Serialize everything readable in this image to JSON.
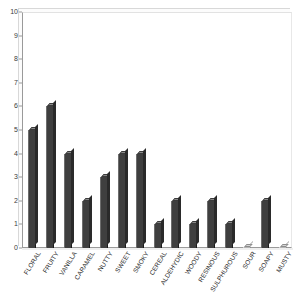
{
  "chart_data": {
    "type": "bar",
    "title": "",
    "subtitle": "",
    "xlabel": "",
    "ylabel": "",
    "ylim": [
      0,
      10
    ],
    "ytick_step": 1,
    "grid": false,
    "legend": "none",
    "orientation": "vertical",
    "bar_color": "#3f3f3f",
    "bar_style": "3d-column",
    "categories": [
      "FLORAL",
      "FRUITY",
      "VANILLA",
      "CARAMEL",
      "NUTTY",
      "SWEET",
      "SMOKY",
      "CEREAL",
      "ALDEHYDIC",
      "WOODY",
      "RESINOUS",
      "SULPHUROUS",
      "SOUR",
      "SOAPY",
      "MUSTY"
    ],
    "values": [
      5,
      6,
      4,
      2,
      3,
      4,
      4,
      1,
      2,
      1,
      2,
      1,
      0,
      2,
      0
    ],
    "ytick_labels": [
      "0",
      "1",
      "2",
      "3",
      "4",
      "5",
      "6",
      "7",
      "8",
      "9",
      "10"
    ]
  },
  "axes": {
    "y_min_label": "0",
    "y_max_label": "10"
  }
}
